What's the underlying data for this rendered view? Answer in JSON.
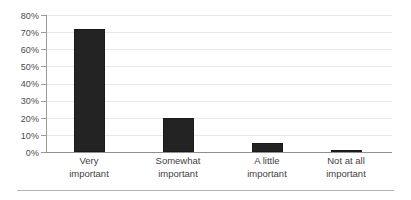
{
  "chart_data": {
    "type": "bar",
    "title": "",
    "subtitle": "",
    "xlabel": "",
    "ylabel": "",
    "categories": [
      "Very important",
      "Somewhat important",
      "A little important",
      "Not at all important"
    ],
    "category_lines": [
      [
        "Very",
        "important"
      ],
      [
        "Somewhat",
        "important"
      ],
      [
        "A little",
        "important"
      ],
      [
        "Not at all",
        "important"
      ]
    ],
    "values": [
      72,
      20,
      5,
      1
    ],
    "value_labels": [
      "72%",
      "20%",
      "5%",
      "1%"
    ],
    "ylim": [
      0,
      80
    ],
    "y_ticks": [
      0,
      10,
      20,
      30,
      40,
      50,
      60,
      70,
      80
    ],
    "y_tick_labels": [
      "0%",
      "10%",
      "20%",
      "30%",
      "40%",
      "50%",
      "60%",
      "70%",
      "80%"
    ],
    "grid": true,
    "grid_axis": "y",
    "legend": false,
    "legend_position": "none",
    "bar_color": "#232323",
    "gridline_color": "#e8e8e8",
    "axis_color": "#8f8f8f",
    "text_color": "#3f3f3f",
    "background_color": "#ffffff"
  },
  "decor": {
    "bottom_rule_color": "#b4b4b4"
  }
}
